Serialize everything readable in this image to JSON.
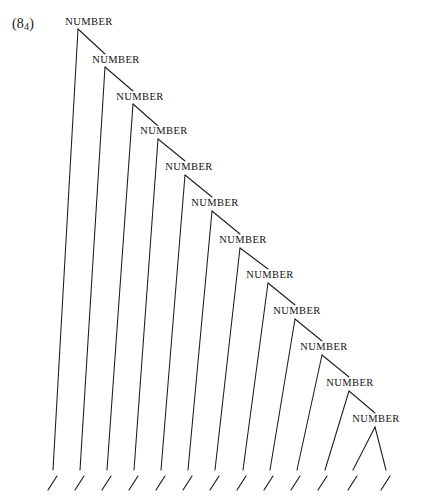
{
  "figure": {
    "example_number": "(8",
    "example_subscript": "4",
    "example_close": ")",
    "example_full": "(8₄)",
    "node_label": "NUMBER",
    "terminal_glyph": "/",
    "ink_color": "#1b1b1b",
    "background_color": "#ffffff",
    "node_count": 12,
    "terminal_count": 13,
    "nodes": [
      {
        "label": "NUMBER",
        "x": 89,
        "y": 22,
        "apex_x": 78,
        "apex_y": 29
      },
      {
        "label": "NUMBER",
        "x": 116,
        "y": 60,
        "apex_x": 105,
        "apex_y": 67
      },
      {
        "label": "NUMBER",
        "x": 140,
        "y": 97,
        "apex_x": 133,
        "apex_y": 104
      },
      {
        "label": "NUMBER",
        "x": 164,
        "y": 131,
        "apex_x": 158,
        "apex_y": 139
      },
      {
        "label": "NUMBER",
        "x": 189,
        "y": 167,
        "apex_x": 185,
        "apex_y": 175
      },
      {
        "label": "NUMBER",
        "x": 215,
        "y": 203,
        "apex_x": 212,
        "apex_y": 211
      },
      {
        "label": "NUMBER",
        "x": 243,
        "y": 240,
        "apex_x": 240,
        "apex_y": 248
      },
      {
        "label": "NUMBER",
        "x": 270,
        "y": 275,
        "apex_x": 268,
        "apex_y": 283
      },
      {
        "label": "NUMBER",
        "x": 297,
        "y": 311,
        "apex_x": 295,
        "apex_y": 319
      },
      {
        "label": "NUMBER",
        "x": 324,
        "y": 347,
        "apex_x": 322,
        "apex_y": 355
      },
      {
        "label": "NUMBER",
        "x": 350,
        "y": 383,
        "apex_x": 349,
        "apex_y": 391
      },
      {
        "label": "NUMBER",
        "x": 376,
        "y": 419,
        "apex_x": 375,
        "apex_y": 427
      }
    ],
    "left_branches": [
      {
        "from_x": 78,
        "from_y": 29,
        "to_x": 53,
        "to_y": 470
      },
      {
        "from_x": 105,
        "from_y": 67,
        "to_x": 80,
        "to_y": 470
      },
      {
        "from_x": 133,
        "from_y": 104,
        "to_x": 107,
        "to_y": 470
      },
      {
        "from_x": 158,
        "from_y": 139,
        "to_x": 134,
        "to_y": 470
      },
      {
        "from_x": 185,
        "from_y": 175,
        "to_x": 161,
        "to_y": 470
      },
      {
        "from_x": 212,
        "from_y": 211,
        "to_x": 188,
        "to_y": 470
      },
      {
        "from_x": 240,
        "from_y": 248,
        "to_x": 215,
        "to_y": 470
      },
      {
        "from_x": 268,
        "from_y": 283,
        "to_x": 243,
        "to_y": 470
      },
      {
        "from_x": 295,
        "from_y": 319,
        "to_x": 270,
        "to_y": 470
      },
      {
        "from_x": 322,
        "from_y": 355,
        "to_x": 297,
        "to_y": 470
      },
      {
        "from_x": 349,
        "from_y": 391,
        "to_x": 325,
        "to_y": 470
      },
      {
        "from_x": 375,
        "from_y": 427,
        "to_x": 353,
        "to_y": 470
      }
    ],
    "right_branches": [
      {
        "from_x": 78,
        "from_y": 29,
        "to_x": 105,
        "to_y": 54
      },
      {
        "from_x": 105,
        "from_y": 67,
        "to_x": 133,
        "to_y": 91
      },
      {
        "from_x": 133,
        "from_y": 104,
        "to_x": 158,
        "to_y": 126
      },
      {
        "from_x": 158,
        "from_y": 139,
        "to_x": 185,
        "to_y": 161
      },
      {
        "from_x": 185,
        "from_y": 175,
        "to_x": 212,
        "to_y": 197
      },
      {
        "from_x": 212,
        "from_y": 211,
        "to_x": 240,
        "to_y": 234
      },
      {
        "from_x": 240,
        "from_y": 248,
        "to_x": 268,
        "to_y": 269
      },
      {
        "from_x": 268,
        "from_y": 283,
        "to_x": 295,
        "to_y": 305
      },
      {
        "from_x": 295,
        "from_y": 319,
        "to_x": 322,
        "to_y": 341
      },
      {
        "from_x": 322,
        "from_y": 355,
        "to_x": 349,
        "to_y": 377
      },
      {
        "from_x": 349,
        "from_y": 391,
        "to_x": 375,
        "to_y": 413
      },
      {
        "from_x": 375,
        "from_y": 427,
        "to_x": 386,
        "to_y": 470
      }
    ],
    "terminals": [
      {
        "x": 52,
        "y": 476
      },
      {
        "x": 79,
        "y": 476
      },
      {
        "x": 106,
        "y": 476
      },
      {
        "x": 133,
        "y": 476
      },
      {
        "x": 160,
        "y": 476
      },
      {
        "x": 187,
        "y": 476
      },
      {
        "x": 214,
        "y": 476
      },
      {
        "x": 241,
        "y": 476
      },
      {
        "x": 268,
        "y": 476
      },
      {
        "x": 295,
        "y": 476
      },
      {
        "x": 322,
        "y": 476
      },
      {
        "x": 352,
        "y": 476
      },
      {
        "x": 385,
        "y": 476
      }
    ]
  }
}
